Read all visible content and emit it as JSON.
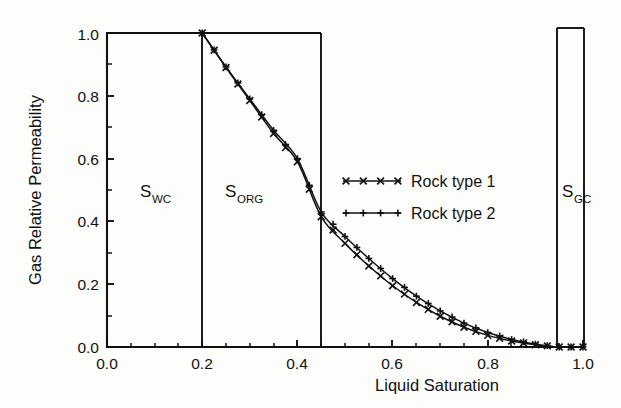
{
  "chart_data": {
    "type": "line",
    "title": "",
    "xlabel": "Liquid Saturation",
    "ylabel": "Gas Relative Permeability",
    "xlim": [
      0.0,
      1.0
    ],
    "ylim": [
      0.0,
      1.0
    ],
    "grid": false,
    "legend_position": "center-right",
    "xticks": [
      "0.0",
      "0.2",
      "0.4",
      "0.6",
      "0.8",
      "1.0"
    ],
    "xtick_values": [
      0.0,
      0.2,
      0.4,
      0.6,
      0.8,
      1.0
    ],
    "yticks": [
      "0.0",
      "0.2",
      "0.4",
      "0.6",
      "0.8",
      "1.0"
    ],
    "ytick_values": [
      0.0,
      0.2,
      0.4,
      0.6,
      0.8,
      1.0
    ],
    "minor_tick_step": 0.05,
    "series": [
      {
        "name": "Rock type 1",
        "marker": "x-cross",
        "x": [
          0.2,
          0.25,
          0.3,
          0.35,
          0.4,
          0.45,
          0.5,
          0.55,
          0.6,
          0.65,
          0.7,
          0.75,
          0.8,
          0.85,
          0.9,
          0.95,
          1.0
        ],
        "y": [
          1.0,
          0.89,
          0.785,
          0.68,
          0.59,
          0.415,
          0.33,
          0.258,
          0.195,
          0.142,
          0.098,
          0.063,
          0.037,
          0.019,
          0.007,
          0.0,
          0.0
        ]
      },
      {
        "name": "Rock type 2",
        "marker": "plus",
        "x": [
          0.2,
          0.25,
          0.3,
          0.35,
          0.4,
          0.45,
          0.5,
          0.55,
          0.6,
          0.65,
          0.7,
          0.75,
          0.8,
          0.85,
          0.9,
          0.95,
          1.0
        ],
        "y": [
          1.0,
          0.892,
          0.79,
          0.69,
          0.6,
          0.43,
          0.352,
          0.282,
          0.218,
          0.162,
          0.115,
          0.076,
          0.046,
          0.024,
          0.009,
          0.0,
          0.0
        ]
      }
    ],
    "annotations": [
      {
        "label": "S",
        "subscript": "WC",
        "x_range": [
          0.0,
          0.2
        ],
        "text": "SWC"
      },
      {
        "label": "S",
        "subscript": "ORG",
        "x_range": [
          0.2,
          0.45
        ],
        "text": "SORG"
      },
      {
        "label": "S",
        "subscript": "GC",
        "x_range": [
          0.95,
          1.0
        ],
        "text": "SGC"
      }
    ],
    "reference_lines": [
      0.2,
      0.45,
      0.95,
      1.0
    ]
  },
  "axes": {
    "x_label": "Liquid Saturation",
    "y_label": "Gas Relative Permeability",
    "x_ticks": [
      "0.0",
      "0.2",
      "0.4",
      "0.6",
      "0.8",
      "1.0"
    ],
    "y_ticks": [
      "0.0",
      "0.2",
      "0.4",
      "0.6",
      "0.8",
      "1.0"
    ]
  },
  "legend": {
    "entries": [
      {
        "label": "Rock type 1",
        "marker": "x-cross"
      },
      {
        "label": "Rock type 2",
        "marker": "plus"
      }
    ]
  },
  "zones": {
    "swc": {
      "base": "S",
      "sub": "WC"
    },
    "sorg": {
      "base": "S",
      "sub": "ORG"
    },
    "sgc": {
      "base": "S",
      "sub": "GC"
    }
  },
  "colors": {
    "ink": "#111111",
    "background": "#fdfdfc"
  }
}
